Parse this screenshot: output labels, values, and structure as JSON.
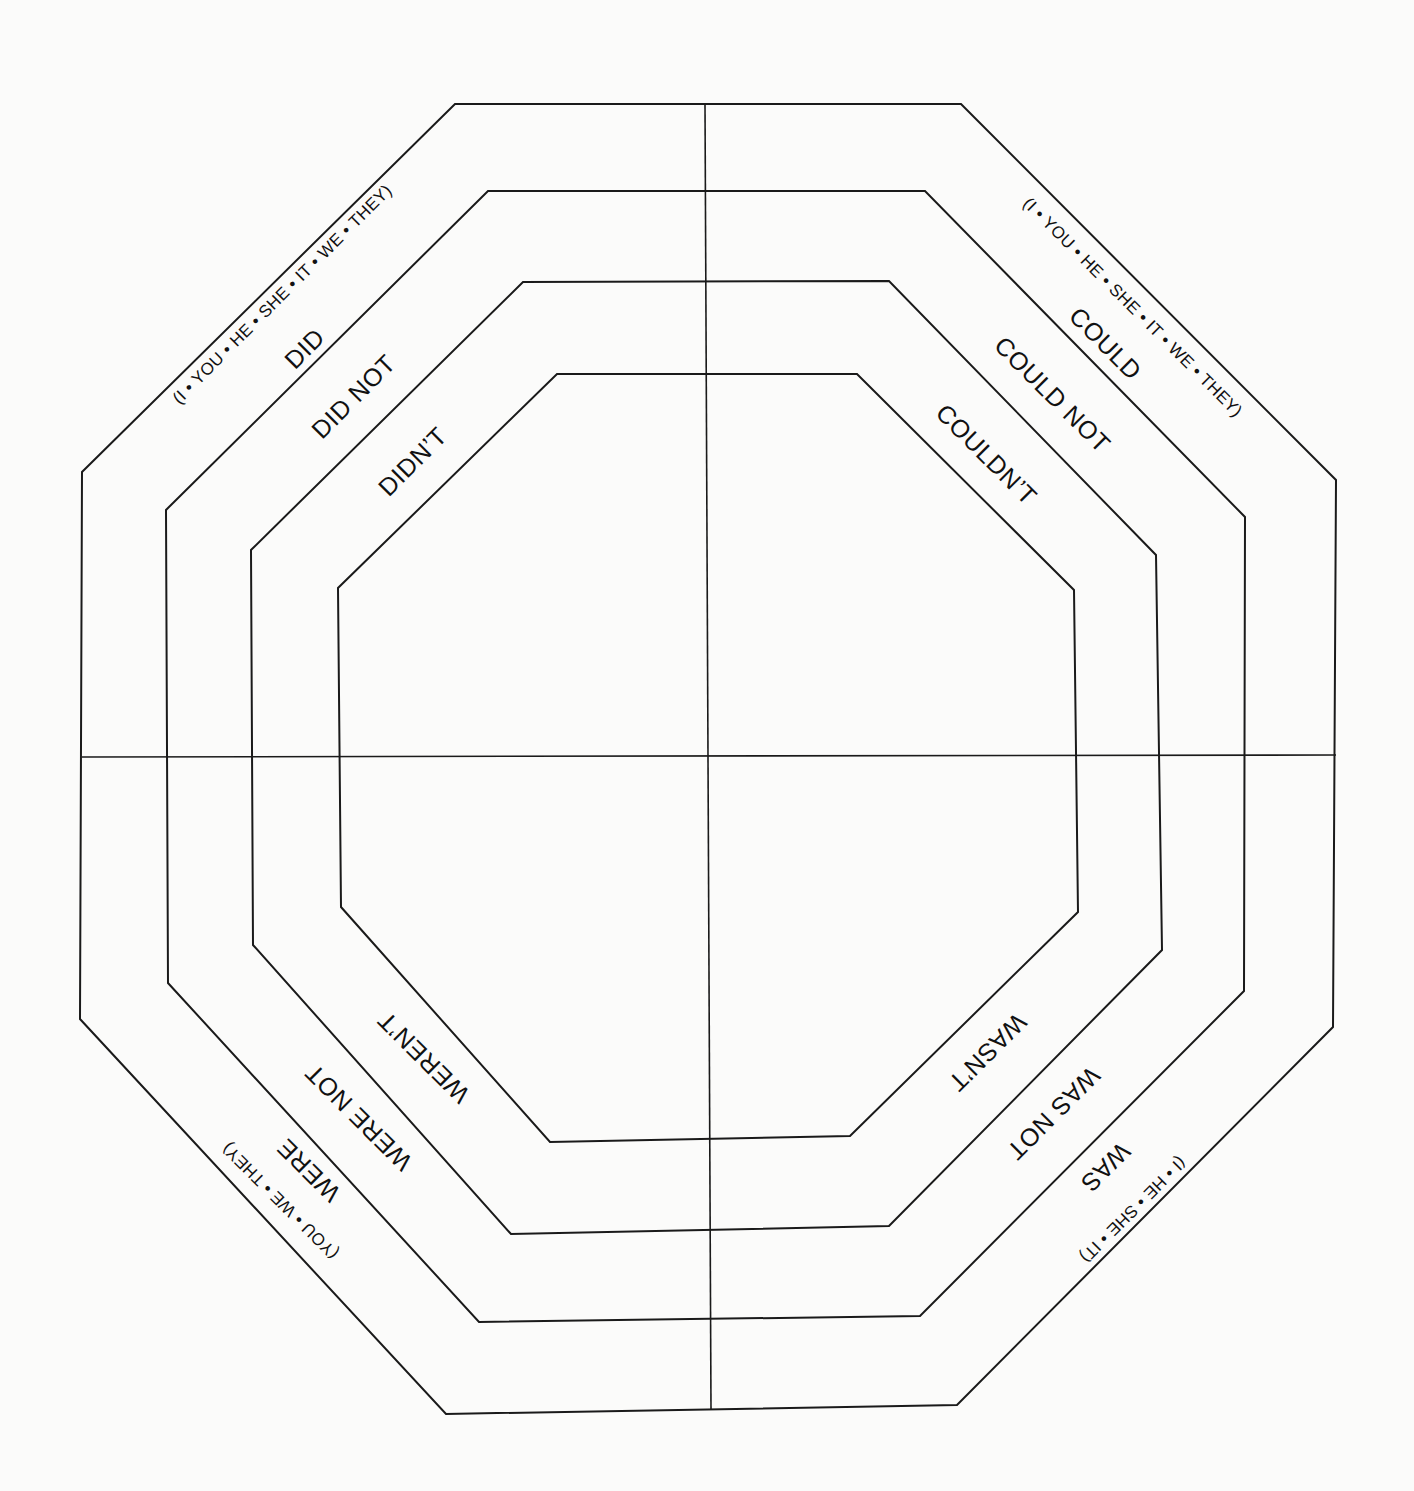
{
  "diagram": {
    "title": "",
    "colors": {
      "background": "#fbfbfa",
      "line": "#1a1a1a",
      "text": "#111111"
    },
    "octagons": [
      {
        "name": "outer",
        "points": "455,104 961,104 1336,480 1333,1027 957,1405 446,1414 80,1019 82,472"
      },
      {
        "name": "ring-2",
        "points": "488,191 925,191 1245,517 1244,991 920,1316 479,1322 168,983 166,510"
      },
      {
        "name": "ring-3",
        "points": "523,282 889,281 1156,555 1162,950 889,1226 511,1234 253,945 251,550"
      },
      {
        "name": "inner",
        "points": "557,374 857,374 1074,590 1078,912 850,1136 550,1142 341,907 338,588"
      }
    ],
    "axes": {
      "vertical": {
        "x1": 705,
        "y1": 104,
        "x2": 711,
        "y2": 1410
      },
      "horizontal": {
        "x1": 82,
        "y1": 757,
        "x2": 1336,
        "y2": 755
      }
    },
    "quadrants": {
      "top_left": {
        "pronouns": "(I • YOU • HE • SHE • IT • WE • THEY)",
        "ring_1": "DID",
        "ring_2": "DID NOT",
        "ring_3": "DIDN’T"
      },
      "top_right": {
        "pronouns": "(I • YOU • HE • SHE • IT • WE • THEY)",
        "ring_1": "COULD",
        "ring_2": "COULD NOT",
        "ring_3": "COULDN’T"
      },
      "bottom_right": {
        "pronouns": "(I • HE • SHE • IT)",
        "ring_1": "WAS",
        "ring_2": "WAS NOT",
        "ring_3": "WASN’T"
      },
      "bottom_left": {
        "pronouns": "(YOU • WE • THEY)",
        "ring_1": "WERE",
        "ring_2": "WERE NOT",
        "ring_3": "WEREN’T"
      }
    }
  }
}
